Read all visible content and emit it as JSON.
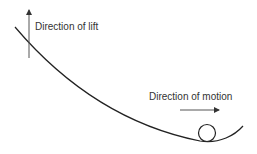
{
  "diagram": {
    "labels": {
      "lift": "Direction of lift",
      "motion": "Direction of motion"
    },
    "elements": {
      "curve": "track-curve",
      "ball": "ball-circle",
      "lift_arrow": "up-arrow",
      "motion_arrow": "right-arrow"
    },
    "colors": {
      "line": "#222222",
      "arrow": "#444444",
      "text": "#333333"
    }
  }
}
